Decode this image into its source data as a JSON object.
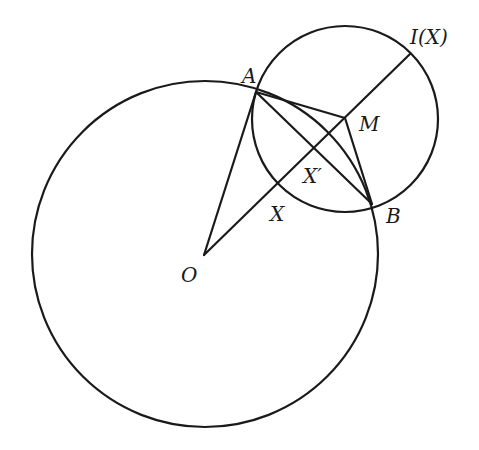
{
  "figure": {
    "type": "geometry-construction"
  },
  "points": {
    "O": "O",
    "A": "A",
    "B": "B",
    "M": "M",
    "X": "X",
    "X_prime": "X′",
    "I_X": "I(X)"
  },
  "circles": [
    {
      "name": "circle-O",
      "center": "O",
      "through": [
        "A",
        "B",
        "X"
      ]
    },
    {
      "name": "circle-M",
      "center": "M",
      "through": [
        "A",
        "B",
        "X",
        "I(X)"
      ]
    }
  ],
  "segments": [
    [
      "O",
      "A"
    ],
    [
      "O",
      "I(X)"
    ],
    [
      "A",
      "B"
    ],
    [
      "A",
      "M"
    ],
    [
      "M",
      "B"
    ]
  ],
  "colors": {
    "ink": "#1a1a1a",
    "background": "#ffffff"
  }
}
